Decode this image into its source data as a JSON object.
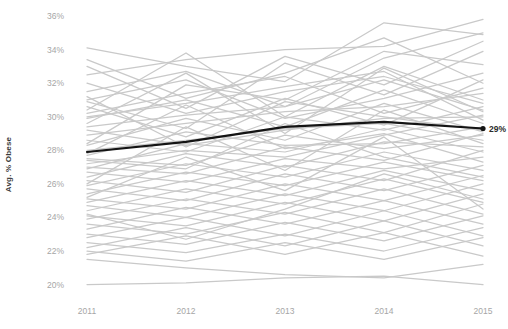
{
  "chart_data": {
    "type": "line",
    "title": "",
    "subtitle": "",
    "xlabel": "",
    "ylabel": "Avg. % Obese",
    "x": [
      2011,
      2012,
      2013,
      2014,
      2015
    ],
    "x_tick_labels": [
      "2011",
      "2012",
      "2013",
      "2014",
      "2015"
    ],
    "y_tick_labels": [
      "36%",
      "34%",
      "32%",
      "30%",
      "28%",
      "26%",
      "24%",
      "22%",
      "20%"
    ],
    "y_tick_values": [
      36,
      34,
      32,
      30,
      28,
      26,
      24,
      22,
      20
    ],
    "ylim": [
      19.2,
      36.6
    ],
    "xlim": [
      2011,
      2015
    ],
    "grid": false,
    "legend": "none",
    "annotations": [
      {
        "text": "29%",
        "x": 2015,
        "y": 29.3,
        "series": "Average",
        "position": "right-of-endpoint"
      }
    ],
    "colors": {
      "background_series": "#c9c9c9",
      "highlight_series": "#141414",
      "tick_label": "#a6a6a6",
      "axis_title": "#3a3a3a",
      "annotation": "#2b2b2b",
      "background": "#ffffff"
    },
    "highlight_series": {
      "name": "Average",
      "values": [
        27.9,
        28.5,
        29.4,
        29.7,
        29.3
      ],
      "color": "#141414",
      "linewidth": 2.2,
      "end_marker": true
    },
    "series": [
      {
        "name": "s01",
        "values": [
          34.1,
          33.0,
          32.1,
          35.6,
          34.9
        ]
      },
      {
        "name": "s02",
        "values": [
          32.5,
          33.4,
          34.0,
          34.2,
          35.8
        ]
      },
      {
        "name": "s03",
        "values": [
          33.4,
          31.1,
          32.6,
          34.7,
          32.0
        ]
      },
      {
        "name": "s04",
        "values": [
          31.5,
          32.7,
          30.6,
          33.5,
          35.0
        ]
      },
      {
        "name": "s05",
        "values": [
          30.9,
          29.3,
          33.2,
          31.3,
          33.9
        ]
      },
      {
        "name": "s06",
        "values": [
          32.0,
          30.2,
          31.5,
          32.4,
          30.8
        ]
      },
      {
        "name": "s07",
        "values": [
          31.0,
          32.2,
          29.9,
          31.1,
          32.6
        ]
      },
      {
        "name": "s08",
        "values": [
          30.2,
          31.4,
          32.4,
          30.2,
          31.7
        ]
      },
      {
        "name": "s09",
        "values": [
          29.4,
          30.1,
          30.6,
          32.2,
          30.4
        ]
      },
      {
        "name": "s10",
        "values": [
          30.6,
          28.8,
          31.1,
          29.5,
          32.2
        ]
      },
      {
        "name": "s11",
        "values": [
          29.9,
          31.0,
          29.4,
          31.6,
          29.6
        ]
      },
      {
        "name": "s12",
        "values": [
          28.9,
          29.6,
          30.3,
          30.6,
          31.4
        ]
      },
      {
        "name": "s13",
        "values": [
          29.2,
          28.3,
          29.2,
          29.9,
          30.0
        ]
      },
      {
        "name": "s14",
        "values": [
          28.3,
          29.9,
          28.6,
          30.8,
          29.1
        ]
      },
      {
        "name": "s15",
        "values": [
          28.6,
          27.9,
          30.0,
          29.2,
          30.6
        ]
      },
      {
        "name": "s16",
        "values": [
          27.7,
          29.1,
          28.3,
          28.4,
          29.4
        ]
      },
      {
        "name": "s17",
        "values": [
          28.0,
          28.6,
          29.3,
          29.6,
          28.6
        ]
      },
      {
        "name": "s18",
        "values": [
          27.2,
          28.0,
          27.6,
          28.9,
          30.1
        ]
      },
      {
        "name": "s19",
        "values": [
          27.5,
          27.1,
          28.9,
          28.1,
          28.9
        ]
      },
      {
        "name": "s20",
        "values": [
          26.9,
          28.4,
          27.9,
          29.3,
          27.9
        ]
      },
      {
        "name": "s21",
        "values": [
          27.0,
          26.6,
          28.2,
          27.4,
          29.0
        ]
      },
      {
        "name": "s22",
        "values": [
          26.4,
          27.8,
          27.0,
          28.5,
          28.2
        ]
      },
      {
        "name": "s23",
        "values": [
          26.7,
          26.1,
          27.5,
          26.9,
          27.6
        ]
      },
      {
        "name": "s24",
        "values": [
          25.9,
          27.2,
          26.4,
          27.9,
          26.8
        ]
      },
      {
        "name": "s25",
        "values": [
          26.2,
          25.5,
          27.1,
          26.2,
          28.0
        ]
      },
      {
        "name": "s26",
        "values": [
          25.4,
          26.7,
          25.9,
          27.3,
          26.2
        ]
      },
      {
        "name": "s27",
        "values": [
          25.7,
          25.0,
          26.6,
          25.6,
          27.1
        ]
      },
      {
        "name": "s28",
        "values": [
          24.9,
          26.2,
          25.3,
          26.8,
          25.6
        ]
      },
      {
        "name": "s29",
        "values": [
          25.1,
          24.5,
          26.0,
          25.0,
          26.5
        ]
      },
      {
        "name": "s30",
        "values": [
          24.4,
          25.7,
          24.8,
          26.3,
          24.9
        ]
      },
      {
        "name": "s31",
        "values": [
          24.7,
          24.0,
          25.4,
          24.4,
          26.0
        ]
      },
      {
        "name": "s32",
        "values": [
          23.9,
          25.1,
          24.2,
          25.7,
          24.2
        ]
      },
      {
        "name": "s33",
        "values": [
          24.1,
          23.5,
          24.9,
          23.8,
          25.4
        ]
      },
      {
        "name": "s34",
        "values": [
          23.3,
          24.6,
          23.6,
          25.0,
          23.6
        ]
      },
      {
        "name": "s35",
        "values": [
          23.6,
          23.0,
          24.3,
          23.1,
          24.8
        ]
      },
      {
        "name": "s36",
        "values": [
          22.8,
          24.0,
          22.9,
          24.4,
          22.9
        ]
      },
      {
        "name": "s37",
        "values": [
          23.0,
          22.4,
          23.7,
          22.6,
          24.1
        ]
      },
      {
        "name": "s38",
        "values": [
          22.2,
          23.4,
          22.3,
          23.8,
          22.3
        ]
      },
      {
        "name": "s39",
        "values": [
          22.5,
          21.9,
          23.0,
          22.0,
          23.4
        ]
      },
      {
        "name": "s40",
        "values": [
          21.8,
          22.9,
          21.8,
          23.1,
          21.7
        ]
      },
      {
        "name": "s41",
        "values": [
          22.0,
          21.4,
          22.5,
          21.5,
          22.8
        ]
      },
      {
        "name": "s42",
        "values": [
          30.4,
          33.8,
          30.0,
          33.0,
          31.0
        ]
      },
      {
        "name": "s43",
        "values": [
          33.0,
          30.5,
          33.6,
          31.9,
          34.5
        ]
      },
      {
        "name": "s44",
        "values": [
          28.4,
          31.9,
          31.0,
          33.9,
          33.1
        ]
      },
      {
        "name": "s45",
        "values": [
          31.2,
          28.2,
          30.9,
          30.0,
          29.2
        ]
      },
      {
        "name": "s46",
        "values": [
          29.6,
          32.6,
          29.0,
          32.9,
          30.3
        ]
      },
      {
        "name": "s47",
        "values": [
          27.8,
          30.7,
          28.1,
          29.0,
          27.3
        ]
      },
      {
        "name": "s48",
        "values": [
          26.0,
          29.4,
          26.8,
          30.4,
          28.4
        ]
      },
      {
        "name": "s49",
        "values": [
          24.2,
          22.7,
          24.5,
          26.6,
          25.1
        ]
      },
      {
        "name": "s50",
        "values": [
          20.0,
          20.1,
          20.4,
          20.5,
          20.0
        ]
      },
      {
        "name": "s51",
        "values": [
          21.5,
          21.0,
          20.6,
          20.4,
          21.2
        ]
      },
      {
        "name": "s52",
        "values": [
          30.0,
          30.8,
          31.8,
          32.7,
          29.8
        ]
      },
      {
        "name": "s53",
        "values": [
          27.4,
          26.9,
          29.6,
          27.6,
          26.4
        ]
      },
      {
        "name": "s54",
        "values": [
          25.2,
          27.6,
          25.6,
          28.8,
          24.5
        ]
      }
    ]
  }
}
